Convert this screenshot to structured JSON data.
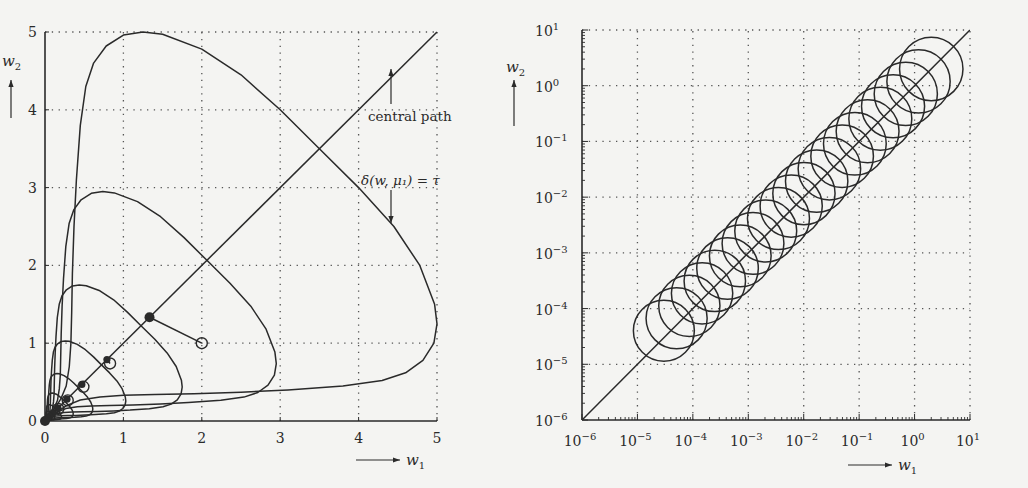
{
  "chart_data": [
    {
      "type": "line",
      "title": "",
      "xlabel": "w1",
      "ylabel": "w2",
      "xlim": [
        0,
        5
      ],
      "ylim": [
        0,
        5
      ],
      "grid": true,
      "x_ticks": [
        "0",
        "1",
        "2",
        "3",
        "4",
        "5"
      ],
      "y_ticks": [
        "0",
        "1",
        "2",
        "3",
        "4",
        "5"
      ],
      "annotations": [
        {
          "text": "central path",
          "arrow_to": [
            4.2,
            4.2
          ]
        },
        {
          "text": "δ(w, μ1) = τ",
          "arrow_to": [
            4.2,
            2.4
          ]
        }
      ],
      "series": [
        {
          "name": "central path",
          "kind": "line",
          "points": [
            [
              0,
              0
            ],
            [
              5,
              5
            ]
          ]
        },
        {
          "name": "level curves δ(w, μk) = τ",
          "kind": "closed-curves",
          "peak_w2": [
            5.0,
            2.95,
            1.75,
            1.03,
            0.61,
            0.36,
            0.21,
            0.125
          ]
        },
        {
          "name": "starting point",
          "kind": "marker-open-circle",
          "points": [
            [
              2.0,
              1.0
            ]
          ]
        },
        {
          "name": "first step",
          "kind": "line",
          "points": [
            [
              2.0,
              1.0
            ],
            [
              1.333,
              1.333
            ]
          ]
        },
        {
          "name": "central path points",
          "kind": "marker-filled",
          "points": [
            [
              1.333,
              1.333
            ],
            [
              0.79,
              0.79
            ],
            [
              0.47,
              0.47
            ],
            [
              0.28,
              0.28
            ],
            [
              0.165,
              0.165
            ],
            [
              0.1,
              0.1
            ],
            [
              0.06,
              0.06
            ],
            [
              0.035,
              0.035
            ],
            [
              0.0,
              0.0
            ]
          ]
        },
        {
          "name": "iterates",
          "kind": "marker-open-circle",
          "points": [
            [
              0.83,
              0.74
            ],
            [
              0.49,
              0.44
            ],
            [
              0.29,
              0.265
            ],
            [
              0.17,
              0.155
            ]
          ]
        }
      ]
    },
    {
      "type": "line",
      "title": "",
      "xlabel": "w1",
      "ylabel": "w2",
      "xscale": "log",
      "yscale": "log",
      "xlim": [
        1e-06,
        10
      ],
      "ylim": [
        1e-06,
        10
      ],
      "grid": true,
      "x_ticks": [
        "10^-6",
        "10^-5",
        "10^-4",
        "10^-3",
        "10^-2",
        "10^-1",
        "10^0",
        "10^1"
      ],
      "y_ticks": [
        "10^-6",
        "10^-5",
        "10^-4",
        "10^-3",
        "10^-2",
        "10^-1",
        "10^0",
        "10^1"
      ],
      "series": [
        {
          "name": "central path",
          "kind": "line",
          "points": [
            [
              1e-06,
              1e-06
            ],
            [
              10,
              10
            ]
          ]
        },
        {
          "name": "neighbourhood circles",
          "kind": "circles",
          "count": 22,
          "first_center": [
            3e-05,
            4e-05
          ],
          "last_center": [
            2.0,
            2.0
          ],
          "radius_decades": 0.55
        }
      ]
    }
  ],
  "left": {
    "xlabel": "w",
    "xlabel_sub": "1",
    "ylabel": "w",
    "ylabel_sub": "2",
    "annot_path": "central path",
    "annot_delta": "δ(w, μ₁) = τ"
  },
  "right": {
    "xlabel": "w",
    "xlabel_sub": "1",
    "ylabel": "w",
    "ylabel_sub": "2"
  }
}
